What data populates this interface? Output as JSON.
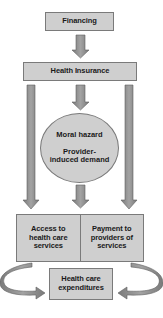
{
  "diagram": {
    "nodes": {
      "financing": "Financing",
      "health_insurance": "Health Insurance",
      "moral_hazard": "Moral hazard",
      "provider_induced_demand": "Provider-induced demand",
      "access": "Access to health care services",
      "payment": "Payment to providers of services",
      "expenditures": "Health care expenditures"
    },
    "edges": [
      {
        "from": "financing",
        "to": "health_insurance"
      },
      {
        "from": "health_insurance",
        "to": "ellipse"
      },
      {
        "from": "ellipse",
        "to": "split_box"
      },
      {
        "from": "health_insurance",
        "to": "access",
        "route": "left-long"
      },
      {
        "from": "health_insurance",
        "to": "payment",
        "route": "right-long"
      },
      {
        "from": "access",
        "to": "expenditures",
        "route": "curved-left"
      },
      {
        "from": "payment",
        "to": "expenditures",
        "route": "curved-right"
      }
    ],
    "colors": {
      "box_fill": "#cfcfcf",
      "box_border": "#7a7a7a",
      "arrow_fill": "#8c8c8c",
      "arrow_edge": "#5f5f5f",
      "text": "#1a1a1a"
    }
  }
}
